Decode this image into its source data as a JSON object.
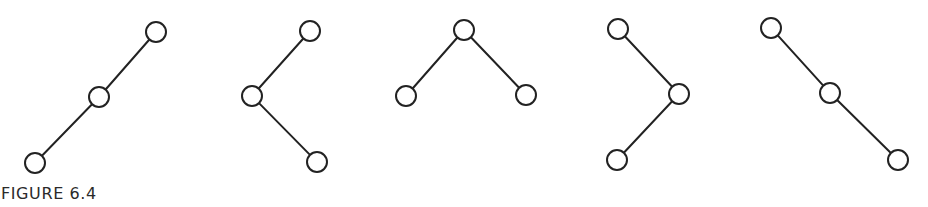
{
  "caption": "FIGURE 6.4",
  "style": {
    "stroke_color": "#222222",
    "node_fill": "#ffffff",
    "node_radius": 10,
    "stroke_width": 2
  },
  "trees": [
    {
      "name": "tree-1",
      "description": "Right-leaning chain: bottom-left to middle to top-right",
      "nodes": [
        {
          "id": "a",
          "x": 156,
          "y": 32
        },
        {
          "id": "b",
          "x": 99,
          "y": 97
        },
        {
          "id": "c",
          "x": 35,
          "y": 163
        }
      ],
      "edges": [
        [
          "a",
          "b"
        ],
        [
          "b",
          "c"
        ]
      ]
    },
    {
      "name": "tree-2",
      "description": "Zig-zag: top-right to middle-left to bottom-right",
      "nodes": [
        {
          "id": "a",
          "x": 310,
          "y": 31
        },
        {
          "id": "b",
          "x": 252,
          "y": 96
        },
        {
          "id": "c",
          "x": 317,
          "y": 162
        }
      ],
      "edges": [
        [
          "a",
          "b"
        ],
        [
          "b",
          "c"
        ]
      ]
    },
    {
      "name": "tree-3",
      "description": "Balanced: root with left and right child",
      "nodes": [
        {
          "id": "a",
          "x": 464,
          "y": 30
        },
        {
          "id": "b",
          "x": 406,
          "y": 96
        },
        {
          "id": "c",
          "x": 526,
          "y": 95
        }
      ],
      "edges": [
        [
          "a",
          "b"
        ],
        [
          "a",
          "c"
        ]
      ]
    },
    {
      "name": "tree-4",
      "description": "Zig-zag: top-left to middle-right to bottom-left",
      "nodes": [
        {
          "id": "a",
          "x": 618,
          "y": 29
        },
        {
          "id": "b",
          "x": 679,
          "y": 94
        },
        {
          "id": "c",
          "x": 617,
          "y": 160
        }
      ],
      "edges": [
        [
          "a",
          "b"
        ],
        [
          "b",
          "c"
        ]
      ]
    },
    {
      "name": "tree-5",
      "description": "Left-leaning chain: top-left to middle to bottom-right",
      "nodes": [
        {
          "id": "a",
          "x": 771,
          "y": 28
        },
        {
          "id": "b",
          "x": 830,
          "y": 93
        },
        {
          "id": "c",
          "x": 898,
          "y": 160
        }
      ],
      "edges": [
        [
          "a",
          "b"
        ],
        [
          "b",
          "c"
        ]
      ]
    }
  ]
}
